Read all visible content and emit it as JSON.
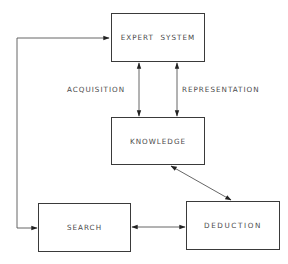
{
  "diagram": {
    "nodes": [
      {
        "id": "expert_system",
        "label": "EXPERT  SYSTEM"
      },
      {
        "id": "knowledge",
        "label": "KNOWLEDGE"
      },
      {
        "id": "search",
        "label": "SEARCH"
      },
      {
        "id": "deduction",
        "label": "DEDUCTION"
      }
    ],
    "edges": [
      {
        "from": "expert_system",
        "to": "knowledge",
        "label": "ACQUISITION",
        "direction": "both"
      },
      {
        "from": "expert_system",
        "to": "knowledge",
        "label": "REPRESENTATION",
        "direction": "both"
      },
      {
        "from": "knowledge",
        "to": "deduction",
        "label": "",
        "direction": "both"
      },
      {
        "from": "search",
        "to": "deduction",
        "label": "",
        "direction": "both"
      },
      {
        "from": "search",
        "to": "expert_system",
        "label": "",
        "direction": "both"
      }
    ],
    "edge_labels": {
      "acquisition": "ACQUISITION",
      "representation": "REPRESENTATION"
    },
    "colors": {
      "line": "#3a3a3a",
      "text": "#4a4a4a",
      "background": "#ffffff"
    }
  }
}
